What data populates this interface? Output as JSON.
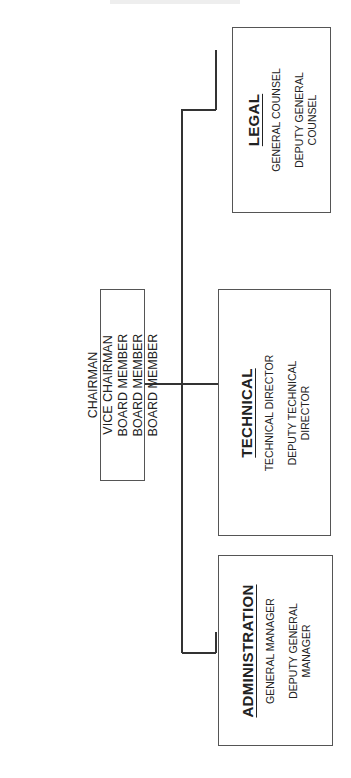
{
  "chart_title_fragment": "",
  "board": {
    "members": [
      "CHAIRMAN",
      "VICE CHAIRMAN",
      "BOARD MEMBER",
      "BOARD MEMBER",
      "BOARD MEMBER"
    ]
  },
  "departments": [
    {
      "name": "LEGAL",
      "roles": [
        "GENERAL COUNSEL",
        "DEPUTY GENERAL COUNSEL"
      ]
    },
    {
      "name": "TECHNICAL",
      "roles": [
        "TECHNICAL DIRECTOR",
        "DEPUTY TECHNICAL DIRECTOR"
      ]
    },
    {
      "name": "ADMINISTRATION",
      "roles": [
        "GENERAL MANAGER",
        "DEPUTY GENERAL MANAGER"
      ]
    }
  ],
  "colors": {
    "line": "#333333",
    "border": "#555555",
    "background": "#ffffff"
  }
}
